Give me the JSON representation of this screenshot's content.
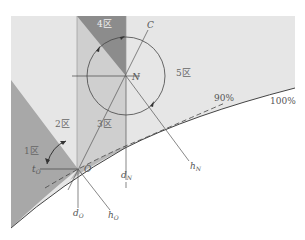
{
  "diagram": {
    "zones": [
      {
        "id": "1",
        "label": "1区"
      },
      {
        "id": "2",
        "label": "2区"
      },
      {
        "id": "3",
        "label": "3区"
      },
      {
        "id": "4",
        "label": "4区"
      },
      {
        "id": "5",
        "label": "5区"
      }
    ],
    "points": {
      "O": "O",
      "N": "N",
      "C": "C"
    },
    "lines": {
      "d_O": {
        "main": "d",
        "sub": "O"
      },
      "d_N": {
        "main": "d",
        "sub": "N"
      },
      "h_O": {
        "main": "h",
        "sub": "O"
      },
      "h_N": {
        "main": "h",
        "sub": "N"
      },
      "t_O": {
        "main": "t",
        "sub": "O"
      }
    },
    "curves": {
      "c90": "90%",
      "c100": "100%"
    },
    "colors": {
      "background_region": "#e6e6e6",
      "band_region": "#cfcfcf",
      "dark_region": "#8c8c8c",
      "zone1_region": "#a8a8a8",
      "line": "#444444"
    }
  }
}
